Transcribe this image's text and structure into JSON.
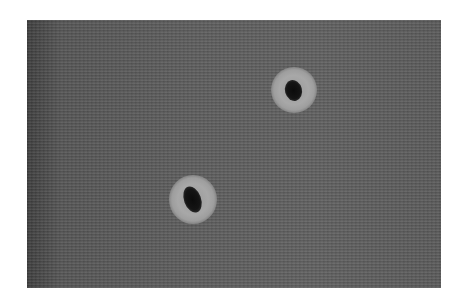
{
  "image": {
    "description": "Grayscale micrograph showing two dark spots surrounded by light halos on a finely textured striped background",
    "background_color": "#5a5a5a",
    "spots": [
      {
        "name": "upper-right-spot",
        "cx": 294,
        "cy": 90,
        "halo_radius": 23,
        "core_w": 16,
        "core_h": 20,
        "core_color": "#0b0b0b",
        "halo_color": "#a8a8a8"
      },
      {
        "name": "lower-left-spot",
        "cx": 193,
        "cy": 199,
        "halo_radius": 24,
        "core_w": 15,
        "core_h": 24,
        "core_color": "#0b0b0b",
        "halo_color": "#a8a8a8"
      }
    ]
  }
}
